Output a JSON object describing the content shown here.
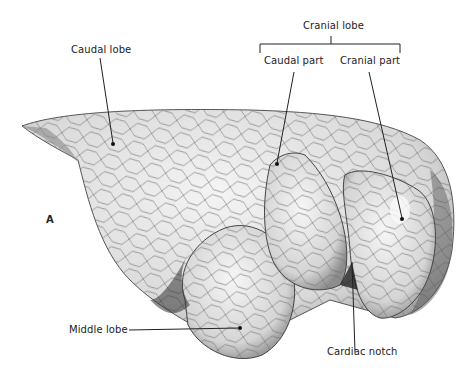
{
  "figure": {
    "panel_letter": "A",
    "labels": {
      "caudal_lobe": "Caudal lobe",
      "cranial_lobe": "Cranial lobe",
      "caudal_part": "Caudal part",
      "cranial_part": "Cranial part",
      "middle_lobe": "Middle lobe",
      "cardiac_notch": "Cardiac notch"
    },
    "colors": {
      "tissue": "#e6e6e6",
      "septa": "#555555",
      "shadow": "#6a6a6a",
      "leader": "#222222"
    }
  }
}
